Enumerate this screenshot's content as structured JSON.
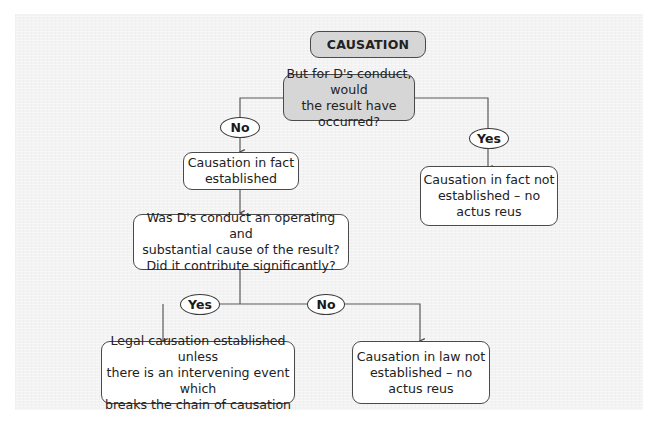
{
  "diagram": {
    "title": "CAUSATION",
    "question1": "But for D's conduct, would\nthe result have occurred?",
    "branch1_no": "No",
    "branch1_yes": "Yes",
    "fact_established": "Causation in fact\nestablished",
    "fact_not_established": "Causation in fact not\nestablished – no\nactus reus",
    "question2": "Was D's conduct an operating and\nsubstantial cause of the result?\nDid it contribute significantly?",
    "branch2_yes": "Yes",
    "branch2_no": "No",
    "legal_established": "Legal causation established unless\nthere is an intervening event which\nbreaks the chain of causation",
    "law_not_established": "Causation in law not\nestablished – no\nactus reus"
  },
  "colors": {
    "panel_bg": "#f3f3f3",
    "box_bg": "#ffffff",
    "shaded_box_bg": "#d6d6d6",
    "stroke": "#4a4a4a"
  }
}
